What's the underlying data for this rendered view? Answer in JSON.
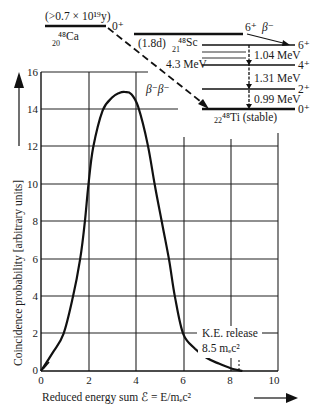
{
  "chart_data": {
    "type": "line",
    "title": "",
    "xlabel": "Reduced energy sum ℰ = E/mₑc²",
    "ylabel": "Coincidence probability  [arbitrary units]",
    "xlim": [
      0,
      10
    ],
    "ylim": [
      0,
      16
    ],
    "xticks": [
      0,
      2,
      4,
      6,
      8,
      10
    ],
    "yticks": [
      0,
      2,
      4,
      6,
      8,
      10,
      12,
      14,
      16
    ],
    "grid": true,
    "series": [
      {
        "name": "β⁻β⁻ coincidence spectrum",
        "x": [
          0,
          0.5,
          0.95,
          1.35,
          1.65,
          1.85,
          2.0,
          2.2,
          2.6,
          3.0,
          3.3,
          3.55,
          3.8,
          4.1,
          4.5,
          4.8,
          5.1,
          5.4,
          5.65,
          6.0,
          6.5,
          7.0,
          7.5,
          8.0,
          8.5
        ],
        "values": [
          0,
          1.0,
          2,
          4,
          6,
          8,
          10,
          12,
          14,
          14.7,
          14.95,
          15.0,
          14.9,
          14.2,
          12.2,
          10,
          8,
          6,
          4,
          2,
          1.2,
          0.7,
          0.4,
          0.15,
          0
        ]
      }
    ],
    "annotations": [
      {
        "text": "K.E. release",
        "x": 7.5,
        "y": 1.4
      },
      {
        "text": "8.5 mₑc²",
        "x": 7.5,
        "y": 0.5
      },
      {
        "text": "β⁻β⁻",
        "x": 6.2,
        "y": 14.5
      }
    ]
  },
  "level_diagram": {
    "ca48": {
      "nucleus": "⁴⁸Ca",
      "sub": "20",
      "halflife": "(>0.7 × 10¹⁹y)",
      "spin": "0⁺"
    },
    "sc48": {
      "nucleus": "⁴⁸Sc",
      "sub": "21",
      "halflife": "(1.8d)",
      "spin": "6⁺"
    },
    "ti48": {
      "nucleus": "⁴⁸Ti (stable)",
      "sub": "22",
      "spin": "0⁺"
    },
    "beta_label": "β⁻",
    "double_beta_label": "β⁻β⁻",
    "q_value": "4.3 MeV",
    "levels": [
      {
        "spin": "6⁺"
      },
      {
        "spin": "4⁺"
      },
      {
        "spin": "2⁺"
      },
      {
        "spin": "0⁺"
      }
    ],
    "transitions": [
      "1.04 MeV",
      "1.31 MeV",
      "0.99 MeV"
    ]
  }
}
